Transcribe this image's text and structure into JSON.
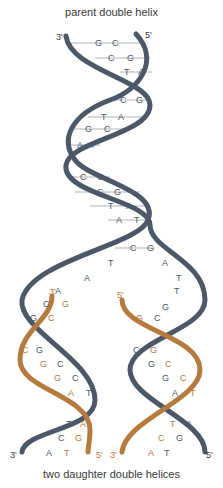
{
  "title_top": "parent double helix",
  "title_bottom": "two daughter double helices",
  "colors": {
    "parent": "#4b5867",
    "daughter": "#b57a3e",
    "rung": "#8a8f96",
    "text": "#3a3a3a"
  },
  "labels": {
    "top_left": "3'",
    "top_right": "5'",
    "fork_left": "3'",
    "fork_right": "5'",
    "bottom_left_3": "3'",
    "bottom_left_5": "5'",
    "bottom_right_3": "3'",
    "bottom_right_5": "5'"
  },
  "parent_pairs": [
    [
      "G",
      "C"
    ],
    [
      "C",
      "G"
    ],
    [
      "T",
      "A"
    ],
    [
      "C",
      "G"
    ],
    [
      "T",
      "A"
    ],
    [
      "G",
      "C"
    ],
    [
      "A",
      "T"
    ],
    [
      "C",
      "G"
    ],
    [
      "C",
      "G"
    ],
    [
      "T",
      "A"
    ],
    [
      "A",
      "T"
    ],
    [
      "C",
      "G"
    ]
  ],
  "fork_unpaired": {
    "left": [
      "T",
      "A",
      "A"
    ],
    "right": [
      "A",
      "T",
      "T",
      "G"
    ]
  },
  "left_daughter_pairs": [
    [
      "C",
      "G"
    ],
    [
      "G",
      "C"
    ],
    [
      "C",
      "G"
    ],
    [
      "G",
      "C"
    ],
    [
      "G",
      "C"
    ],
    [
      "A",
      "T"
    ],
    [
      "T",
      "A"
    ],
    [
      "C",
      "G"
    ],
    [
      "A",
      "T"
    ]
  ],
  "right_daughter_pairs": [
    [
      "G",
      "C"
    ],
    [
      "C",
      "G"
    ],
    [
      "G",
      "C"
    ],
    [
      "G",
      "C"
    ],
    [
      "A",
      "T"
    ],
    [
      "T",
      "A"
    ],
    [
      "C",
      "G"
    ],
    [
      "A",
      "T"
    ]
  ]
}
